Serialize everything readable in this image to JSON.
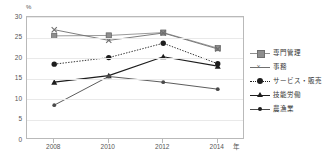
{
  "chart_data": {
    "type": "line",
    "title": "",
    "xlabel": "年",
    "ylabel": "%",
    "x": [
      2008,
      2010,
      2012,
      2014
    ],
    "xticklabels": [
      "2008",
      "2010",
      "2012",
      "2014"
    ],
    "yticklabels": [
      "0",
      "5",
      "10",
      "15",
      "20",
      "25",
      "30"
    ],
    "yticks": [
      0,
      5,
      10,
      15,
      20,
      25,
      30
    ],
    "ylim": [
      0,
      30
    ],
    "grid": "horizontal",
    "legend_position": "right",
    "series": [
      {
        "name": "専門管理",
        "values": [
          25.4,
          25.5,
          26.2,
          22.4
        ],
        "marker": "square",
        "line": "solid",
        "color": "#8e8e8e"
      },
      {
        "name": "事務",
        "values": [
          26.9,
          24.3,
          26.1,
          22.2
        ],
        "marker": "x",
        "line": "solid",
        "color": "#6f6f6f"
      },
      {
        "name": "サービス・販売",
        "values": [
          18.5,
          20.1,
          23.6,
          18.6
        ],
        "marker": "circle",
        "line": "dotted",
        "color": "#1d1d1d"
      },
      {
        "name": "技能労働",
        "values": [
          14.1,
          15.7,
          20.3,
          18.0
        ],
        "marker": "triangle",
        "line": "solid",
        "color": "#1d1d1d"
      },
      {
        "name": "農漁業",
        "values": [
          8.5,
          15.5,
          14.1,
          12.4
        ],
        "marker": "circle-small",
        "line": "solid",
        "color": "#4a4a4a"
      }
    ]
  },
  "axes": {
    "y_unit": "%",
    "x_unit": "年"
  }
}
